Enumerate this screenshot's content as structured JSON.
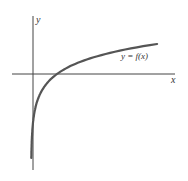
{
  "chart_data": {
    "type": "line",
    "title": "",
    "xlabel": "x",
    "ylabel": "y",
    "series": [
      {
        "name": "y = f(x)",
        "function": "logarithmic-shaped curve: vertical asymptote at x=0 (y to -infinity), crosses x-axis at x=1, increases slowly for x>1"
      }
    ],
    "annotations": [
      {
        "text": "y = f(x)"
      }
    ],
    "grid": false,
    "legend": "none"
  },
  "labels": {
    "x_axis": "x",
    "y_axis": "y",
    "curve": "y = f(x)"
  },
  "colors": {
    "axis": "#444444",
    "curve": "#555555"
  }
}
